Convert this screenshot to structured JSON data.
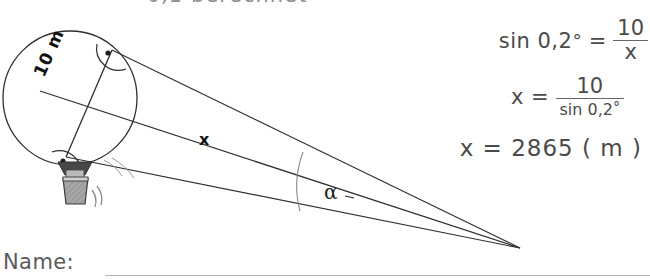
{
  "document": {
    "type": "math-worksheet-scan",
    "background_color": "#ffffff",
    "ink_color": "#3a3a3a"
  },
  "top_cut_text": "0,1  berechnet",
  "diagram": {
    "balloon_diameter_label": "10 m",
    "distance_label": "x",
    "angle_label": "α",
    "right_angle_marker_count": 2,
    "sight_line_count": 3,
    "circle": {
      "cx": 70,
      "cy": 98,
      "r": 67
    },
    "apex": {
      "x": 520,
      "y": 248
    },
    "tangent_point_top": {
      "x": 112,
      "y": 50
    },
    "tangent_point_bottom": {
      "x": 66,
      "y": 157
    },
    "colors": {
      "line": "#2f2f2f",
      "basket_fill": "#9a9a9a",
      "skirt_fill": "#4a4a4a",
      "basket_light": "#cccccc"
    }
  },
  "math": {
    "equation_1": {
      "lhs": "sin 0,2",
      "degree": "°",
      "equals": "=",
      "numerator": "10",
      "denominator": "x"
    },
    "equation_2": {
      "lhs": "x",
      "equals": "=",
      "numerator": "10",
      "denominator": "sin 0,2",
      "degree": "°"
    },
    "equation_3": {
      "text": "x = 2865 ( m )"
    }
  },
  "footer": {
    "name_label": "Name:"
  }
}
